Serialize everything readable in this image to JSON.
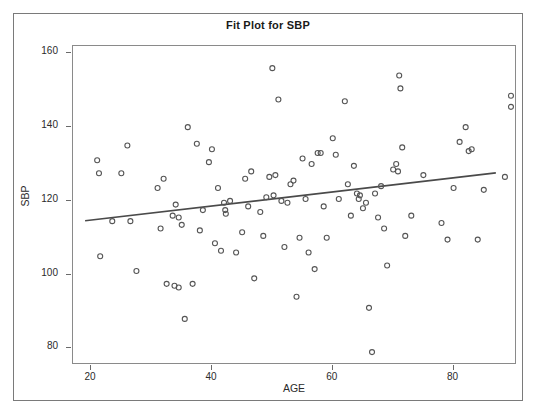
{
  "chart_data": {
    "type": "scatter",
    "title": "Fit Plot for SBP",
    "xlabel": "AGE",
    "ylabel": "SBP",
    "xlim": [
      17,
      90.5
    ],
    "ylim": [
      75.5,
      162
    ],
    "xticks": [
      20,
      40,
      60,
      80
    ],
    "yticks": [
      80,
      100,
      120,
      140,
      160
    ],
    "grid": false,
    "legend": null,
    "marker": {
      "shape": "open-circle",
      "color": "#555555",
      "size": 5
    },
    "fit_line": {
      "name": "Linear fit",
      "color": "#4a4a4a",
      "width": 1.6,
      "x": [
        19.0,
        87.0
      ],
      "y": [
        114.6,
        127.6
      ],
      "slope": 0.191,
      "intercept": 110.97
    },
    "points": [
      {
        "x": 21.0,
        "y": 131.0
      },
      {
        "x": 21.3,
        "y": 127.5
      },
      {
        "x": 21.5,
        "y": 105.0
      },
      {
        "x": 23.5,
        "y": 114.5
      },
      {
        "x": 25.0,
        "y": 127.5
      },
      {
        "x": 26.0,
        "y": 135.0
      },
      {
        "x": 26.5,
        "y": 114.5
      },
      {
        "x": 27.5,
        "y": 101.0
      },
      {
        "x": 31.0,
        "y": 123.5
      },
      {
        "x": 31.5,
        "y": 112.5
      },
      {
        "x": 32.0,
        "y": 126.0
      },
      {
        "x": 32.5,
        "y": 97.5
      },
      {
        "x": 33.5,
        "y": 116.0
      },
      {
        "x": 33.8,
        "y": 97.0
      },
      {
        "x": 34.0,
        "y": 119.0
      },
      {
        "x": 34.5,
        "y": 115.5
      },
      {
        "x": 34.5,
        "y": 96.5
      },
      {
        "x": 35.0,
        "y": 113.5
      },
      {
        "x": 35.5,
        "y": 88.0
      },
      {
        "x": 36.0,
        "y": 140.0
      },
      {
        "x": 36.8,
        "y": 97.5
      },
      {
        "x": 37.5,
        "y": 135.5
      },
      {
        "x": 38.0,
        "y": 112.0
      },
      {
        "x": 38.5,
        "y": 117.5
      },
      {
        "x": 39.5,
        "y": 130.5
      },
      {
        "x": 40.0,
        "y": 134.0
      },
      {
        "x": 40.5,
        "y": 108.5
      },
      {
        "x": 41.0,
        "y": 123.5
      },
      {
        "x": 41.5,
        "y": 106.5
      },
      {
        "x": 42.0,
        "y": 119.5
      },
      {
        "x": 42.2,
        "y": 117.5
      },
      {
        "x": 42.3,
        "y": 116.5
      },
      {
        "x": 43.0,
        "y": 120.0
      },
      {
        "x": 44.0,
        "y": 106.0
      },
      {
        "x": 45.0,
        "y": 111.5
      },
      {
        "x": 45.5,
        "y": 126.0
      },
      {
        "x": 46.0,
        "y": 118.5
      },
      {
        "x": 46.5,
        "y": 128.0
      },
      {
        "x": 47.0,
        "y": 99.0
      },
      {
        "x": 48.0,
        "y": 117.0
      },
      {
        "x": 48.5,
        "y": 110.5
      },
      {
        "x": 49.0,
        "y": 121.0
      },
      {
        "x": 49.5,
        "y": 126.5
      },
      {
        "x": 50.0,
        "y": 156.0
      },
      {
        "x": 50.2,
        "y": 121.5
      },
      {
        "x": 50.5,
        "y": 127.0
      },
      {
        "x": 51.0,
        "y": 147.5
      },
      {
        "x": 51.5,
        "y": 120.0
      },
      {
        "x": 52.0,
        "y": 107.5
      },
      {
        "x": 52.5,
        "y": 119.5
      },
      {
        "x": 53.0,
        "y": 124.5
      },
      {
        "x": 53.5,
        "y": 125.5
      },
      {
        "x": 54.0,
        "y": 94.0
      },
      {
        "x": 54.5,
        "y": 110.0
      },
      {
        "x": 55.0,
        "y": 131.5
      },
      {
        "x": 55.5,
        "y": 120.5
      },
      {
        "x": 56.0,
        "y": 106.0
      },
      {
        "x": 56.5,
        "y": 130.0
      },
      {
        "x": 57.0,
        "y": 101.5
      },
      {
        "x": 57.5,
        "y": 133.0
      },
      {
        "x": 58.0,
        "y": 133.0
      },
      {
        "x": 58.5,
        "y": 118.5
      },
      {
        "x": 59.0,
        "y": 110.0
      },
      {
        "x": 60.0,
        "y": 137.0
      },
      {
        "x": 60.5,
        "y": 132.5
      },
      {
        "x": 61.0,
        "y": 120.5
      },
      {
        "x": 62.0,
        "y": 147.0
      },
      {
        "x": 62.5,
        "y": 124.5
      },
      {
        "x": 63.0,
        "y": 116.0
      },
      {
        "x": 63.5,
        "y": 129.5
      },
      {
        "x": 64.0,
        "y": 122.0
      },
      {
        "x": 64.3,
        "y": 120.5
      },
      {
        "x": 64.5,
        "y": 121.5
      },
      {
        "x": 65.0,
        "y": 118.0
      },
      {
        "x": 65.5,
        "y": 119.5
      },
      {
        "x": 66.0,
        "y": 91.0
      },
      {
        "x": 66.5,
        "y": 79.0
      },
      {
        "x": 67.0,
        "y": 122.0
      },
      {
        "x": 67.5,
        "y": 115.5
      },
      {
        "x": 68.0,
        "y": 124.0
      },
      {
        "x": 68.5,
        "y": 112.5
      },
      {
        "x": 69.0,
        "y": 102.5
      },
      {
        "x": 70.0,
        "y": 128.5
      },
      {
        "x": 70.5,
        "y": 130.0
      },
      {
        "x": 70.8,
        "y": 128.0
      },
      {
        "x": 71.0,
        "y": 154.0
      },
      {
        "x": 71.2,
        "y": 150.5
      },
      {
        "x": 71.5,
        "y": 134.5
      },
      {
        "x": 72.0,
        "y": 110.5
      },
      {
        "x": 73.0,
        "y": 116.0
      },
      {
        "x": 75.0,
        "y": 127.0
      },
      {
        "x": 78.0,
        "y": 114.0
      },
      {
        "x": 79.0,
        "y": 109.5
      },
      {
        "x": 80.0,
        "y": 123.5
      },
      {
        "x": 81.0,
        "y": 136.0
      },
      {
        "x": 82.0,
        "y": 140.0
      },
      {
        "x": 82.5,
        "y": 133.5
      },
      {
        "x": 83.0,
        "y": 134.0
      },
      {
        "x": 84.0,
        "y": 109.5
      },
      {
        "x": 85.0,
        "y": 123.0
      },
      {
        "x": 88.5,
        "y": 126.5
      },
      {
        "x": 89.5,
        "y": 148.5
      },
      {
        "x": 89.5,
        "y": 145.5
      }
    ]
  }
}
